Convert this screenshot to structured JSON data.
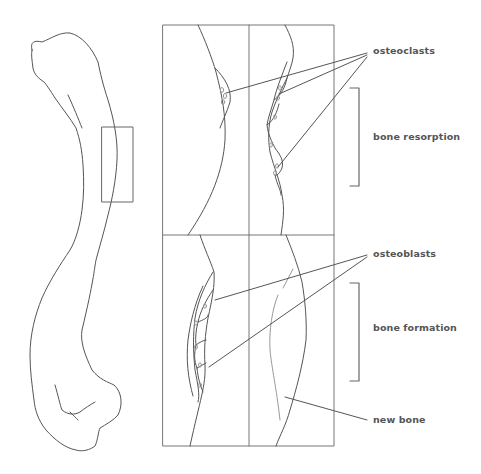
{
  "labels": {
    "osteoclasts": "osteoclasts",
    "bone_resorption": "bone resorption",
    "osteoblasts": "osteoblasts",
    "bone_formation": "bone formation",
    "new_bone": "new bone"
  },
  "colors": {
    "stroke": "#555555",
    "text": "#555555",
    "background": "#ffffff"
  }
}
